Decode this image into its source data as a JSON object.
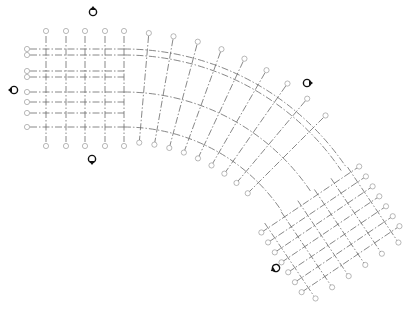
{
  "colors": {
    "grid_line": "#6a6a6a",
    "bubble": "#8a8a8a",
    "marker": "#111111",
    "background": "#ffffff"
  },
  "rect_grid": {
    "vertical_x": [
      46,
      66,
      85,
      105,
      124
    ],
    "vertical_top": 36,
    "vertical_bottom": 142,
    "bubble_top_y": 31,
    "bubble_bottom_y": 146,
    "horizontal_y": [
      49,
      55,
      71,
      77,
      92,
      102,
      113,
      127
    ],
    "horizontal_left": 30,
    "horizontal_right": 124,
    "bubble_left_x": 27
  },
  "curved_grid": {
    "center": [
      124,
      317
    ],
    "arc_radii": [
      268,
      262,
      225,
      190
    ],
    "arc_start_deg": 0,
    "arc_end_deg": 56,
    "radial_angles_deg": [
      5,
      10,
      15,
      20,
      25,
      30,
      35,
      40,
      45
    ],
    "radial_inner": 175,
    "radial_outer": 285
  },
  "rotated_grid": {
    "angle_deg": 56,
    "lines_a_offsets": [
      0,
      12,
      24,
      36,
      48,
      60,
      72
    ],
    "lines_b_offsets": [
      0,
      20,
      40,
      60,
      80,
      100
    ],
    "origin": [
      268,
      228
    ]
  },
  "elevation_markers": [
    {
      "name": "north",
      "x": 93,
      "y": 12,
      "rot": 0
    },
    {
      "name": "west",
      "x": 14,
      "y": 90,
      "rot": -90
    },
    {
      "name": "south",
      "x": 92,
      "y": 159,
      "rot": 180
    },
    {
      "name": "east",
      "x": 307,
      "y": 83,
      "rot": 90
    },
    {
      "name": "southwest",
      "x": 276,
      "y": 268,
      "rot": -120
    }
  ]
}
